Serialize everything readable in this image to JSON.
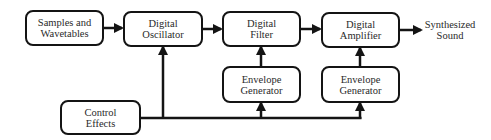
{
  "diagram": {
    "type": "block-diagram",
    "title": "",
    "nodes": [
      {
        "id": "samples",
        "line1": "Samples and",
        "line2": "Wavetables"
      },
      {
        "id": "oscillator",
        "line1": "Digital",
        "line2": "Oscillator"
      },
      {
        "id": "filter",
        "line1": "Digital",
        "line2": "Filter"
      },
      {
        "id": "amplifier",
        "line1": "Digital",
        "line2": "Amplifier"
      },
      {
        "id": "envelope1",
        "line1": "Envelope",
        "line2": "Generator"
      },
      {
        "id": "envelope2",
        "line1": "Envelope",
        "line2": "Generator"
      },
      {
        "id": "control",
        "line1": "Control",
        "line2": "Effects"
      }
    ],
    "output": {
      "line1": "Synthesized",
      "line2": "Sound"
    },
    "edges": [
      {
        "from": "samples",
        "to": "oscillator"
      },
      {
        "from": "oscillator",
        "to": "filter"
      },
      {
        "from": "filter",
        "to": "amplifier"
      },
      {
        "from": "amplifier",
        "to": "output"
      },
      {
        "from": "envelope1",
        "to": "filter"
      },
      {
        "from": "envelope2",
        "to": "amplifier"
      },
      {
        "from": "control",
        "to": "oscillator"
      },
      {
        "from": "control",
        "to": "envelope1"
      },
      {
        "from": "control",
        "to": "envelope2"
      }
    ],
    "colors": {
      "stroke": "#141414",
      "text": "#2a2a2a",
      "background": "#ffffff"
    }
  }
}
